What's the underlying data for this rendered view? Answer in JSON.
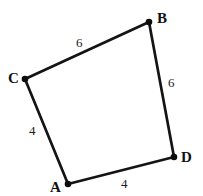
{
  "figure": {
    "kind": "geometry-diagram",
    "shape_name": "quadrilateral-ABCD",
    "background_color": "#ffffff",
    "stroke_color": "#141414",
    "label_color": "#111111",
    "vertices": [
      {
        "id": "A",
        "label": "A",
        "x": 68,
        "y": 184
      },
      {
        "id": "B",
        "label": "B",
        "x": 149,
        "y": 22
      },
      {
        "id": "C",
        "label": "C",
        "x": 25,
        "y": 79
      },
      {
        "id": "D",
        "label": "D",
        "x": 174,
        "y": 157
      }
    ],
    "edges": [
      {
        "id": "CB",
        "from": "C",
        "to": "B",
        "length_label": "6"
      },
      {
        "id": "BD",
        "from": "B",
        "to": "D",
        "length_label": "6"
      },
      {
        "id": "CA",
        "from": "C",
        "to": "A",
        "length_label": "4"
      },
      {
        "id": "AD",
        "from": "A",
        "to": "D",
        "length_label": "4"
      }
    ]
  },
  "labels": {
    "vertex_A": "A",
    "vertex_B": "B",
    "vertex_C": "C",
    "vertex_D": "D",
    "edge_CB": "6",
    "edge_BD": "6",
    "edge_CA": "4",
    "edge_AD": "4"
  }
}
